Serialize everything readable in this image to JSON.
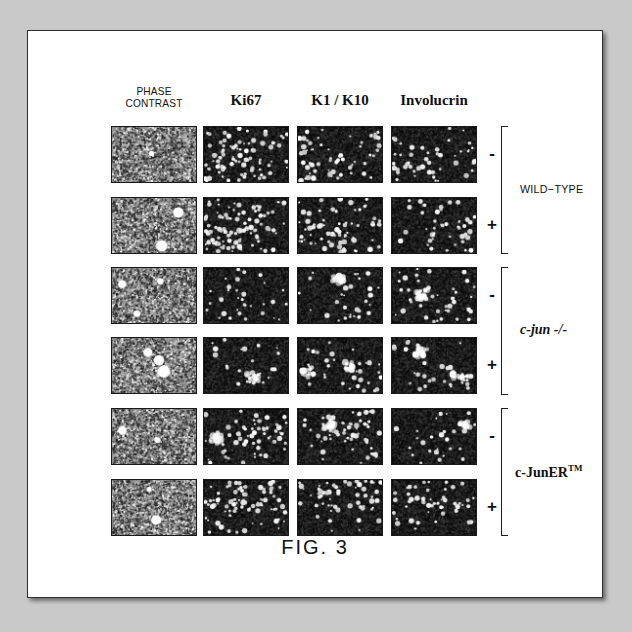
{
  "figure": {
    "caption": "FIG.  3",
    "columns": [
      {
        "id": "phase-contrast",
        "label_line1": "PHASE",
        "label_line2": "CONTRAST",
        "style": "sans",
        "kind": "phase"
      },
      {
        "id": "ki67",
        "label_line1": "Ki67",
        "label_line2": "",
        "style": "serif",
        "kind": "fluor"
      },
      {
        "id": "k1-k10",
        "label_line1": "K1 / K10",
        "label_line2": "",
        "style": "serif",
        "kind": "fluor"
      },
      {
        "id": "involucrin",
        "label_line1": "Involucrin",
        "label_line2": "",
        "style": "serif",
        "kind": "fluor"
      }
    ],
    "groups": [
      {
        "id": "wild-type",
        "label": "WILD−TYPE",
        "style": "sans",
        "rows": 2
      },
      {
        "id": "c-jun-null",
        "label": "c-jun -/-",
        "style": "serif-italic",
        "rows": 2
      },
      {
        "id": "c-juner-tm",
        "label": "c-JunER",
        "superscript": "TM",
        "style": "serif-bold",
        "rows": 2
      }
    ],
    "rows": [
      {
        "group": "wild-type",
        "treatment": "-"
      },
      {
        "group": "wild-type",
        "treatment": "+"
      },
      {
        "group": "c-jun-null",
        "treatment": "-"
      },
      {
        "group": "c-jun-null",
        "treatment": "+"
      },
      {
        "group": "c-juner-tm",
        "treatment": "-"
      },
      {
        "group": "c-juner-tm",
        "treatment": "+"
      }
    ],
    "panels": [
      {
        "row": 0,
        "col": 0,
        "kind": "phase",
        "seed": 101,
        "density": 0.5,
        "blobs": 1
      },
      {
        "row": 0,
        "col": 1,
        "kind": "fluor",
        "seed": 102,
        "density": 0.4,
        "blobs": 0
      },
      {
        "row": 0,
        "col": 2,
        "kind": "fluor",
        "seed": 103,
        "density": 0.34,
        "blobs": 0
      },
      {
        "row": 0,
        "col": 3,
        "kind": "fluor",
        "seed": 104,
        "density": 0.26,
        "blobs": 0
      },
      {
        "row": 1,
        "col": 0,
        "kind": "phase",
        "seed": 201,
        "density": 0.52,
        "blobs": 2
      },
      {
        "row": 1,
        "col": 1,
        "kind": "fluor",
        "seed": 202,
        "density": 0.46,
        "blobs": 0
      },
      {
        "row": 1,
        "col": 2,
        "kind": "fluor",
        "seed": 203,
        "density": 0.38,
        "blobs": 0
      },
      {
        "row": 1,
        "col": 3,
        "kind": "fluor",
        "seed": 204,
        "density": 0.22,
        "blobs": 0
      },
      {
        "row": 2,
        "col": 0,
        "kind": "phase",
        "seed": 301,
        "density": 0.55,
        "blobs": 3
      },
      {
        "row": 2,
        "col": 1,
        "kind": "fluor",
        "seed": 302,
        "density": 0.16,
        "blobs": 0
      },
      {
        "row": 2,
        "col": 2,
        "kind": "fluor",
        "seed": 303,
        "density": 0.14,
        "blobs": 1
      },
      {
        "row": 2,
        "col": 3,
        "kind": "fluor",
        "seed": 304,
        "density": 0.2,
        "blobs": 1
      },
      {
        "row": 3,
        "col": 0,
        "kind": "phase",
        "seed": 401,
        "density": 0.5,
        "blobs": 3
      },
      {
        "row": 3,
        "col": 1,
        "kind": "fluor",
        "seed": 402,
        "density": 0.13,
        "blobs": 1
      },
      {
        "row": 3,
        "col": 2,
        "kind": "fluor",
        "seed": 403,
        "density": 0.17,
        "blobs": 2
      },
      {
        "row": 3,
        "col": 3,
        "kind": "fluor",
        "seed": 404,
        "density": 0.15,
        "blobs": 2
      },
      {
        "row": 4,
        "col": 0,
        "kind": "phase",
        "seed": 501,
        "density": 0.53,
        "blobs": 2
      },
      {
        "row": 4,
        "col": 1,
        "kind": "fluor",
        "seed": 502,
        "density": 0.3,
        "blobs": 1
      },
      {
        "row": 4,
        "col": 2,
        "kind": "fluor",
        "seed": 503,
        "density": 0.33,
        "blobs": 1
      },
      {
        "row": 4,
        "col": 3,
        "kind": "fluor",
        "seed": 504,
        "density": 0.12,
        "blobs": 1
      },
      {
        "row": 5,
        "col": 0,
        "kind": "phase",
        "seed": 601,
        "density": 0.47,
        "blobs": 2
      },
      {
        "row": 5,
        "col": 1,
        "kind": "fluor",
        "seed": 602,
        "density": 0.42,
        "blobs": 0
      },
      {
        "row": 5,
        "col": 2,
        "kind": "fluor",
        "seed": 603,
        "density": 0.3,
        "blobs": 0
      },
      {
        "row": 5,
        "col": 3,
        "kind": "fluor",
        "seed": 604,
        "density": 0.24,
        "blobs": 0
      }
    ],
    "colors": {
      "page_background": "#ffffff",
      "outer_background": "#c9c9c9",
      "border": "#2e2e2e",
      "ink": "#111111",
      "fluor_background": "#0d0d0d",
      "fluor_nuclei": "#ffffff",
      "phase_background": "#8a8a8a"
    },
    "layout": {
      "panel_width": 86,
      "panel_height": 57,
      "col_x": [
        83,
        175,
        269,
        363
      ],
      "row_y": [
        95,
        166,
        236,
        306,
        377,
        448
      ],
      "sign_x": 457,
      "bracket_x": 473,
      "group_label_x": 492,
      "caption_y": 508
    }
  }
}
